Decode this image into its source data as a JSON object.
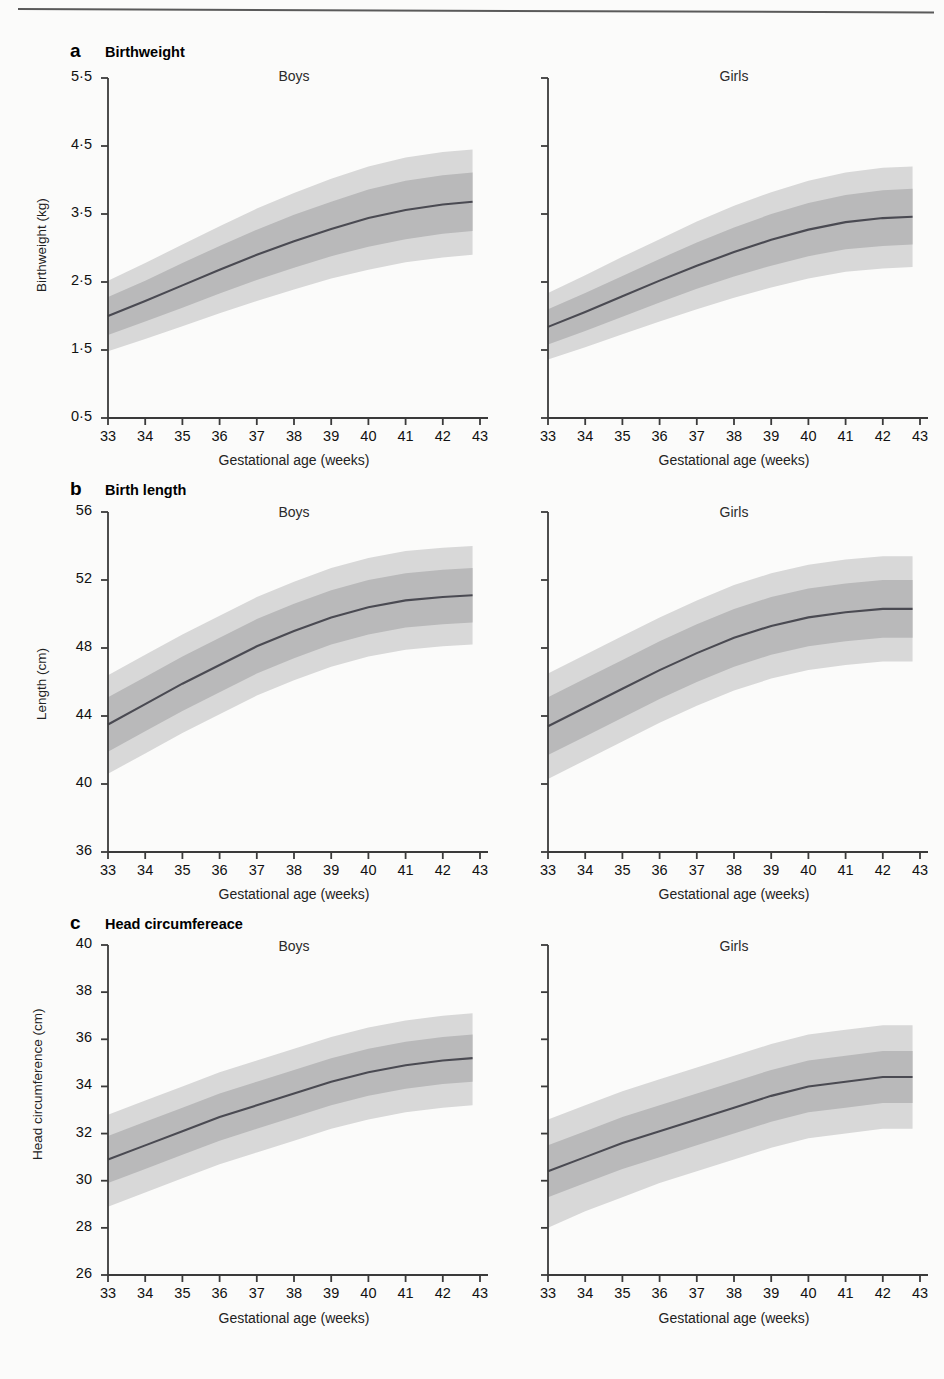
{
  "figure": {
    "kind": "growth-reference-centile-chart",
    "columns": [
      "Boys",
      "Girls"
    ],
    "xlabel": "Gestational age (weeks)",
    "xticks": [
      "33",
      "34",
      "35",
      "36",
      "37",
      "38",
      "39",
      "40",
      "41",
      "42",
      "43"
    ],
    "colors": {
      "median_line": "#4a4a52",
      "inner_band": "#b9b9ba",
      "outer_band": "#d8d8d8",
      "axis": "#3a3a3a",
      "text": "#111111",
      "background": "#fbfbfa"
    }
  },
  "panels": [
    {
      "letter": "a",
      "title": "Birthweight",
      "ylabel": "Birthweight (kg)",
      "yticks": [
        "5·5",
        "4·5",
        "3·5",
        "2·5",
        "1·5",
        "0·5"
      ]
    },
    {
      "letter": "b",
      "title": "Birth length",
      "ylabel": "Length (cm)",
      "yticks": [
        "56",
        "52",
        "48",
        "44",
        "40",
        "36"
      ]
    },
    {
      "letter": "c",
      "title": "Head circumfereace",
      "ylabel": "Head circumference (cm)",
      "yticks": [
        "40",
        "38",
        "36",
        "34",
        "32",
        "30",
        "28",
        "26"
      ]
    }
  ],
  "chart_data": [
    {
      "type": "line",
      "title": "Birthweight",
      "panel": "a",
      "series_group": "Boys",
      "xlabel": "Gestational age (weeks)",
      "ylabel": "Birthweight (kg)",
      "xlim": [
        33,
        43
      ],
      "ylim": [
        0.5,
        5.5
      ],
      "ytickvals": [
        5.5,
        4.5,
        3.5,
        2.5,
        1.5,
        0.5
      ],
      "x": [
        33,
        34,
        35,
        36,
        37,
        38,
        39,
        40,
        41,
        42,
        42.8
      ],
      "grid": false,
      "legend": "none",
      "series": [
        {
          "name": "median",
          "values": [
            2.0,
            2.22,
            2.45,
            2.68,
            2.9,
            3.1,
            3.28,
            3.44,
            3.56,
            3.64,
            3.68
          ]
        },
        {
          "name": "inner_lower",
          "values": [
            1.72,
            1.92,
            2.12,
            2.33,
            2.53,
            2.71,
            2.88,
            3.02,
            3.13,
            3.21,
            3.25
          ]
        },
        {
          "name": "inner_upper",
          "values": [
            2.28,
            2.52,
            2.78,
            3.03,
            3.27,
            3.49,
            3.68,
            3.86,
            3.99,
            4.07,
            4.11
          ]
        },
        {
          "name": "outer_lower",
          "values": [
            1.48,
            1.66,
            1.85,
            2.04,
            2.22,
            2.39,
            2.55,
            2.68,
            2.79,
            2.86,
            2.9
          ]
        },
        {
          "name": "outer_upper",
          "values": [
            2.52,
            2.78,
            3.05,
            3.32,
            3.58,
            3.81,
            4.02,
            4.2,
            4.33,
            4.41,
            4.45
          ]
        }
      ]
    },
    {
      "type": "line",
      "title": "Birthweight",
      "panel": "a",
      "series_group": "Girls",
      "xlabel": "Gestational age (weeks)",
      "ylabel": "Birthweight (kg)",
      "xlim": [
        33,
        43
      ],
      "ylim": [
        0.5,
        5.5
      ],
      "x": [
        33,
        34,
        35,
        36,
        37,
        38,
        39,
        40,
        41,
        42,
        42.8
      ],
      "series": [
        {
          "name": "median",
          "values": [
            1.84,
            2.06,
            2.29,
            2.52,
            2.74,
            2.94,
            3.12,
            3.27,
            3.38,
            3.44,
            3.46
          ]
        },
        {
          "name": "inner_lower",
          "values": [
            1.58,
            1.78,
            1.99,
            2.2,
            2.4,
            2.58,
            2.74,
            2.88,
            2.98,
            3.03,
            3.05
          ]
        },
        {
          "name": "inner_upper",
          "values": [
            2.1,
            2.34,
            2.59,
            2.84,
            3.08,
            3.3,
            3.5,
            3.66,
            3.78,
            3.85,
            3.87
          ]
        },
        {
          "name": "outer_lower",
          "values": [
            1.36,
            1.54,
            1.73,
            1.92,
            2.1,
            2.27,
            2.42,
            2.55,
            2.65,
            2.7,
            2.72
          ]
        },
        {
          "name": "outer_upper",
          "values": [
            2.34,
            2.6,
            2.87,
            3.13,
            3.39,
            3.62,
            3.82,
            3.99,
            4.11,
            4.18,
            4.2
          ]
        }
      ]
    },
    {
      "type": "line",
      "title": "Birth length",
      "panel": "b",
      "series_group": "Boys",
      "xlabel": "Gestational age (weeks)",
      "ylabel": "Length (cm)",
      "xlim": [
        33,
        43
      ],
      "ylim": [
        36,
        56
      ],
      "ytickvals": [
        56,
        52,
        48,
        44,
        40,
        36
      ],
      "x": [
        33,
        34,
        35,
        36,
        37,
        38,
        39,
        40,
        41,
        42,
        42.8
      ],
      "series": [
        {
          "name": "median",
          "values": [
            43.5,
            44.7,
            45.9,
            47.0,
            48.1,
            49.0,
            49.8,
            50.4,
            50.8,
            51.0,
            51.1
          ]
        },
        {
          "name": "inner_lower",
          "values": [
            41.9,
            43.1,
            44.3,
            45.4,
            46.5,
            47.4,
            48.2,
            48.8,
            49.2,
            49.4,
            49.5
          ]
        },
        {
          "name": "inner_upper",
          "values": [
            45.1,
            46.3,
            47.5,
            48.6,
            49.7,
            50.6,
            51.4,
            52.0,
            52.4,
            52.6,
            52.7
          ]
        },
        {
          "name": "outer_lower",
          "values": [
            40.6,
            41.8,
            43.0,
            44.1,
            45.2,
            46.1,
            46.9,
            47.5,
            47.9,
            48.1,
            48.2
          ]
        },
        {
          "name": "outer_upper",
          "values": [
            46.4,
            47.6,
            48.8,
            49.9,
            51.0,
            51.9,
            52.7,
            53.3,
            53.7,
            53.9,
            54.0
          ]
        }
      ]
    },
    {
      "type": "line",
      "title": "Birth length",
      "panel": "b",
      "series_group": "Girls",
      "xlabel": "Gestational age (weeks)",
      "ylabel": "Length (cm)",
      "xlim": [
        33,
        43
      ],
      "ylim": [
        36,
        56
      ],
      "x": [
        33,
        34,
        35,
        36,
        37,
        38,
        39,
        40,
        41,
        42,
        42.8
      ],
      "series": [
        {
          "name": "median",
          "values": [
            43.4,
            44.5,
            45.6,
            46.7,
            47.7,
            48.6,
            49.3,
            49.8,
            50.1,
            50.3,
            50.3
          ]
        },
        {
          "name": "inner_lower",
          "values": [
            41.7,
            42.8,
            43.9,
            45.0,
            46.0,
            46.9,
            47.6,
            48.1,
            48.4,
            48.6,
            48.6
          ]
        },
        {
          "name": "inner_upper",
          "values": [
            45.1,
            46.2,
            47.3,
            48.4,
            49.4,
            50.3,
            51.0,
            51.5,
            51.8,
            52.0,
            52.0
          ]
        },
        {
          "name": "outer_lower",
          "values": [
            40.3,
            41.4,
            42.5,
            43.6,
            44.6,
            45.5,
            46.2,
            46.7,
            47.0,
            47.2,
            47.2
          ]
        },
        {
          "name": "outer_upper",
          "values": [
            46.5,
            47.6,
            48.7,
            49.8,
            50.8,
            51.7,
            52.4,
            52.9,
            53.2,
            53.4,
            53.4
          ]
        }
      ]
    },
    {
      "type": "line",
      "title": "Head circumfereace",
      "panel": "c",
      "series_group": "Boys",
      "xlabel": "Gestational age (weeks)",
      "ylabel": "Head circumference (cm)",
      "xlim": [
        33,
        43
      ],
      "ylim": [
        26,
        40
      ],
      "ytickvals": [
        40,
        38,
        36,
        34,
        32,
        30,
        28,
        26
      ],
      "x": [
        33,
        34,
        35,
        36,
        37,
        38,
        39,
        40,
        41,
        42,
        42.8
      ],
      "series": [
        {
          "name": "median",
          "values": [
            30.9,
            31.5,
            32.1,
            32.7,
            33.2,
            33.7,
            34.2,
            34.6,
            34.9,
            35.1,
            35.2
          ]
        },
        {
          "name": "inner_lower",
          "values": [
            29.9,
            30.5,
            31.1,
            31.7,
            32.2,
            32.7,
            33.2,
            33.6,
            33.9,
            34.1,
            34.2
          ]
        },
        {
          "name": "inner_upper",
          "values": [
            31.9,
            32.5,
            33.1,
            33.7,
            34.2,
            34.7,
            35.2,
            35.6,
            35.9,
            36.1,
            36.2
          ]
        },
        {
          "name": "outer_lower",
          "values": [
            28.9,
            29.5,
            30.1,
            30.7,
            31.2,
            31.7,
            32.2,
            32.6,
            32.9,
            33.1,
            33.2
          ]
        },
        {
          "name": "outer_upper",
          "values": [
            32.8,
            33.4,
            34.0,
            34.6,
            35.1,
            35.6,
            36.1,
            36.5,
            36.8,
            37.0,
            37.1
          ]
        }
      ]
    },
    {
      "type": "line",
      "title": "Head circumfereace",
      "panel": "c",
      "series_group": "Girls",
      "xlabel": "Gestational age (weeks)",
      "ylabel": "Head circumference (cm)",
      "xlim": [
        26,
        40
      ],
      "ylim": [
        26,
        40
      ],
      "x": [
        33,
        34,
        35,
        36,
        37,
        38,
        39,
        40,
        41,
        42,
        42.8
      ],
      "series": [
        {
          "name": "median",
          "values": [
            30.4,
            31.0,
            31.6,
            32.1,
            32.6,
            33.1,
            33.6,
            34.0,
            34.2,
            34.4,
            34.4
          ]
        },
        {
          "name": "inner_lower",
          "values": [
            29.3,
            29.9,
            30.5,
            31.0,
            31.5,
            32.0,
            32.5,
            32.9,
            33.1,
            33.3,
            33.3
          ]
        },
        {
          "name": "inner_upper",
          "values": [
            31.5,
            32.1,
            32.7,
            33.2,
            33.7,
            34.2,
            34.7,
            35.1,
            35.3,
            35.5,
            35.5
          ]
        },
        {
          "name": "outer_lower",
          "values": [
            28.0,
            28.7,
            29.3,
            29.9,
            30.4,
            30.9,
            31.4,
            31.8,
            32.0,
            32.2,
            32.2
          ]
        },
        {
          "name": "outer_upper",
          "values": [
            32.6,
            33.2,
            33.8,
            34.3,
            34.8,
            35.3,
            35.8,
            36.2,
            36.4,
            36.6,
            36.6
          ]
        }
      ]
    }
  ]
}
